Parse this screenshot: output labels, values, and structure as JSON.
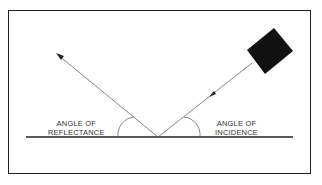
{
  "diagram": {
    "labels": {
      "reflectance": [
        "ANGLE OF",
        "REFLECTANCE"
      ],
      "incidence": [
        "ANGLE OF",
        "INCIDENCE"
      ]
    },
    "colors": {
      "line": "#333333",
      "object": "#111111",
      "border": "#222222"
    }
  }
}
